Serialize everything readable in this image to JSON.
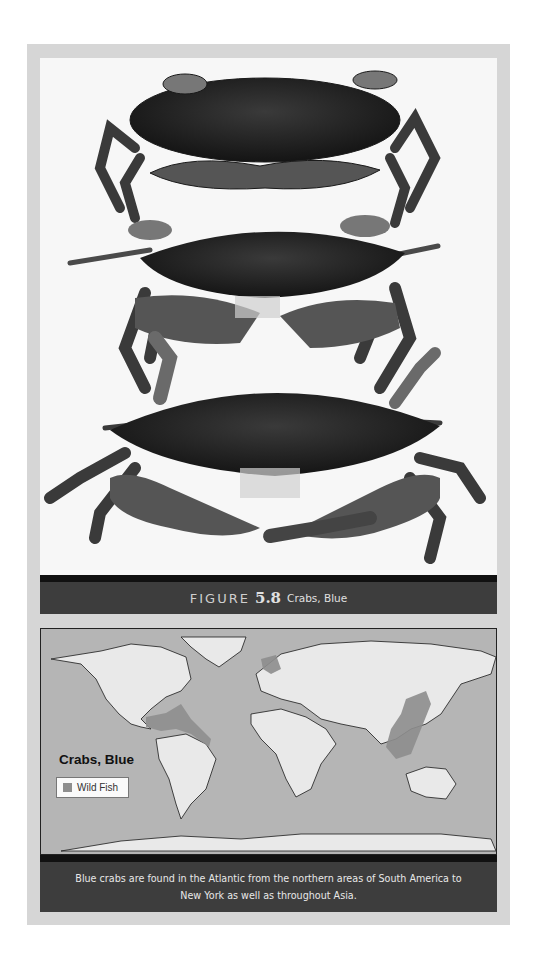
{
  "figure": {
    "label": "FIGURE",
    "number": "5.8",
    "title": "Crabs, Blue"
  },
  "photo": {
    "subject": "three blue crabs on white background",
    "crab_count": 3
  },
  "map": {
    "title": "Crabs, Blue",
    "legend": [
      {
        "label": "Wild Fish",
        "color": "#8e8e8e"
      }
    ],
    "colors": {
      "ocean": "#b5b5b5",
      "land": "#e9e9e9",
      "range": "#8e8e8e",
      "coastline": "#1a1a1a"
    }
  },
  "description": {
    "line1": "Blue crabs are found in the Atlantic from the northern areas of South America to",
    "line2": "New York as well as throughout Asia."
  },
  "colors": {
    "frame": "#d6d6d6",
    "caption_band": "#3d3d3d",
    "black_band": "#111111"
  }
}
